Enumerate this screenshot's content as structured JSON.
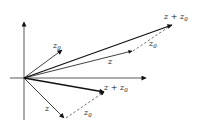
{
  "diagram": {
    "title": "",
    "axes": {
      "origin": [
        24,
        78
      ],
      "horizontal_end": [
        146,
        78
      ],
      "vertical_end": [
        24,
        22
      ]
    },
    "upper": {
      "z0_vector": {
        "label": "z",
        "sub": "0",
        "end": [
          62,
          50
        ]
      },
      "z_vector": {
        "label": "z",
        "end": [
          132,
          51
        ]
      },
      "sum_vector": {
        "label": "z + z",
        "sub": "0",
        "end": [
          172,
          25
        ]
      },
      "dashed_z0": {
        "label": "z",
        "sub": "0",
        "start": [
          133,
          51
        ],
        "end": [
          170,
          26
        ]
      }
    },
    "lower": {
      "z_vector": {
        "label": "z",
        "end": [
          64,
          118
        ]
      },
      "sum_vector": {
        "label": "z + z",
        "sub": "0",
        "end": [
          104,
          92
        ]
      },
      "dashed_z0": {
        "label": "z",
        "sub": "0",
        "start": [
          66,
          118
        ],
        "end": [
          104,
          92
        ]
      }
    },
    "colors": {
      "line": "#111111",
      "background": "#ffffff"
    }
  }
}
